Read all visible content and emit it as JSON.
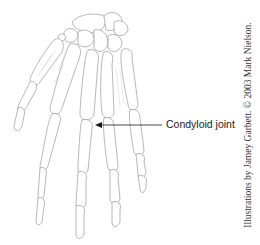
{
  "figure": {
    "label": {
      "text": "Condyloid joint",
      "arrow_target": "metacarpophalangeal joint of middle finger"
    },
    "credit": "Illustrations by Jamey Garbett. © 2003 Mark Nielson."
  },
  "colors": {
    "background": "#ffffff",
    "bone_outline": "#9a9a9a",
    "label_text": "#1a1a1a",
    "arrow": "#1a1a1a"
  }
}
